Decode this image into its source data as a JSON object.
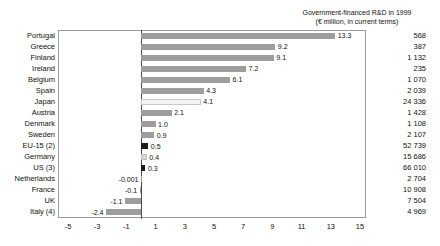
{
  "chart_data": {
    "type": "bar",
    "orientation": "horizontal",
    "title": "Government-financed R&D in 1999 (€ million, in current terms)",
    "title_lines": [
      "Government-financed R&D in 1999",
      "(€ million, in current terms)"
    ],
    "xlabel": "",
    "ylabel": "",
    "xlim": [
      -5.8,
      15.8
    ],
    "xticks": [
      -5,
      -3,
      -1,
      1,
      3,
      5,
      7,
      9,
      11,
      13,
      15
    ],
    "xtick_labels": [
      "-5",
      "-3",
      "-1",
      "1",
      "3",
      "5",
      "7",
      "9",
      "11",
      "13",
      "15"
    ],
    "grid": false,
    "legend": null,
    "categories": [
      "Portugal",
      "Greece",
      "Finland",
      "Ireland",
      "Belgium",
      "Spain",
      "Japan",
      "Austria",
      "Denmark",
      "Sweden",
      "EU-15 (2)",
      "Germany",
      "US (3)",
      "Netherlands",
      "France",
      "UK",
      "Italy (4)"
    ],
    "values": [
      13.3,
      9.2,
      9.1,
      7.2,
      6.1,
      4.3,
      4.1,
      2.1,
      1.0,
      0.9,
      0.5,
      0.4,
      0.3,
      -0.001,
      -0.1,
      -1.1,
      -2.4
    ],
    "value_labels": [
      "13.3",
      "9.2",
      "9.1",
      "7.2",
      "6.1",
      "4.3",
      "4.1",
      "2.1",
      "1.0",
      "0.9",
      "0.5",
      "0.4",
      "0.3",
      "-0.001",
      "-0.1",
      "-1.1",
      "-2.4"
    ],
    "bar_styles": [
      "gray",
      "gray",
      "gray",
      "gray",
      "gray",
      "gray",
      "light",
      "gray",
      "gray",
      "gray",
      "dark",
      "midlight",
      "dark",
      "gray",
      "gray",
      "gray",
      "gray"
    ],
    "secondary_column_header": "Government-financed R&D in 1999 (€ million, in current terms)",
    "secondary_values": [
      "568",
      "387",
      "1 132",
      "235",
      "1 070",
      "2 039",
      "24 336",
      "1 428",
      "1 108",
      "2 107",
      "52 739",
      "15 686",
      "66 010",
      "2 704",
      "10 908",
      "7 504",
      "4 969"
    ],
    "colors": {
      "bar_gray": "#9d9d9d",
      "bar_dark": "#1c1c1c",
      "bar_light": "#f2f2f2",
      "bar_midlight": "#d6d6d6",
      "axis": "#4a4a4a",
      "frame": "#9a9a9a",
      "text": "#111111",
      "background": "#ffffff"
    }
  }
}
